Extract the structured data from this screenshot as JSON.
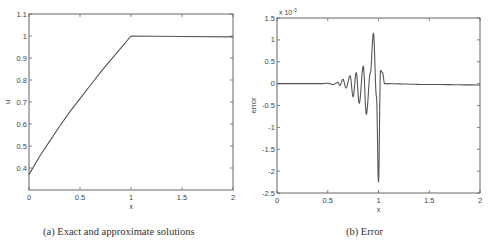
{
  "figure": {
    "captions": {
      "a": "(a) Exact and approximate solutions",
      "b": "(b) Error"
    }
  },
  "chart_data": [
    {
      "type": "line",
      "title": "",
      "caption": "(a) Exact and approximate solutions",
      "xlabel": "x",
      "ylabel": "u",
      "xlim": [
        0,
        2
      ],
      "ylim": [
        0.3,
        1.1
      ],
      "xticks": [
        "0",
        "0.5",
        "1",
        "1.5",
        "2"
      ],
      "yticks": [
        "0.4",
        "0.5",
        "0.6",
        "0.7",
        "0.8",
        "0.9",
        "1",
        "1.1"
      ],
      "grid": false,
      "series": [
        {
          "name": "u",
          "x": [
            0,
            0.1,
            0.2,
            0.3,
            0.4,
            0.5,
            0.6,
            0.7,
            0.8,
            0.9,
            1.0,
            1.5,
            2.0
          ],
          "y": [
            0.37,
            0.45,
            0.52,
            0.59,
            0.655,
            0.715,
            0.775,
            0.835,
            0.89,
            0.945,
            1.0,
            0.998,
            0.996
          ]
        }
      ]
    },
    {
      "type": "line",
      "title": "",
      "caption": "(b) Error",
      "xlabel": "x",
      "ylabel": "error",
      "y_exponent_label": "x 10^-3",
      "xlim": [
        0,
        2
      ],
      "ylim": [
        -2.5,
        1.5
      ],
      "xticks": [
        "0",
        "0.5",
        "1",
        "1.5",
        "2"
      ],
      "yticks": [
        "-2.5",
        "-2",
        "-1.5",
        "-1",
        "-0.5",
        "0",
        "0.5",
        "1",
        "1.5"
      ],
      "grid": false,
      "series": [
        {
          "name": "error (x1e-3)",
          "x": [
            0,
            0.45,
            0.5,
            0.55,
            0.6,
            0.62,
            0.65,
            0.68,
            0.72,
            0.75,
            0.78,
            0.81,
            0.85,
            0.88,
            0.92,
            0.95,
            0.98,
            1.0,
            1.02,
            1.04,
            1.06,
            1.5,
            2.0
          ],
          "y": [
            0,
            0,
            0.01,
            -0.02,
            0.03,
            -0.04,
            0.1,
            -0.1,
            0.18,
            -0.3,
            0.25,
            -0.45,
            0.4,
            -0.7,
            0.25,
            1.15,
            -0.3,
            -2.25,
            0.3,
            0.25,
            0,
            -0.02,
            -0.03
          ]
        }
      ]
    }
  ]
}
